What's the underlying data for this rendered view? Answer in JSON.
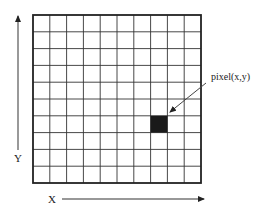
{
  "diagram": {
    "type": "pixel-grid",
    "grid": {
      "columns": 10,
      "rows": 10,
      "origin_px": [
        33,
        15
      ],
      "cell_size_px": 16.8,
      "line_color": "#333333",
      "border_color": "#222222"
    },
    "highlighted_pixel": {
      "column_index": 7,
      "row_index_from_top": 6,
      "fill_color": "#1a1a1a"
    },
    "labels": {
      "pixel": "pixel(x,y)",
      "x_axis": "X",
      "y_axis": "Y"
    },
    "axes": {
      "x_arrow": {
        "from": [
          62,
          199
        ],
        "to": [
          204,
          199
        ],
        "direction": "right"
      },
      "y_arrow": {
        "from": [
          18,
          150
        ],
        "to": [
          18,
          16
        ],
        "direction": "up"
      }
    },
    "pointer_arrow": {
      "from": [
        206,
        83
      ],
      "to": [
        170,
        112
      ]
    }
  }
}
